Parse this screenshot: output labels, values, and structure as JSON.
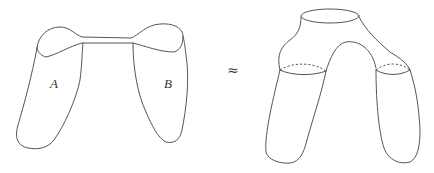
{
  "diagram": {
    "type": "topology-surface-equivalence",
    "left_figure": {
      "description": "Two surfaces A and B joined at their top rims by a thin band (connected sum)",
      "labels": {
        "a": "A",
        "b": "B"
      }
    },
    "relation_symbol": "≈",
    "right_figure": {
      "description": "Pair-of-pants-like surface: a single top boundary circle splitting into two legs, each with a dashed cuff circle"
    },
    "colors": {
      "stroke": "#555555",
      "text": "#333333",
      "background": "#ffffff"
    }
  }
}
